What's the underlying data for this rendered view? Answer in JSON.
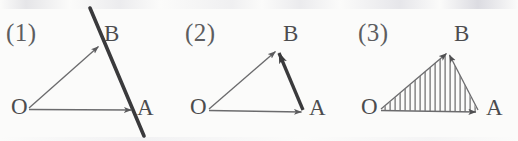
{
  "figure": {
    "caption_numbers": [
      "(1)",
      "(2)",
      "(3)"
    ],
    "background_color": "#fbfbfa",
    "ink_color": "#4c4c4e",
    "thin_stroke_color": "#6b6b6d",
    "thick_stroke_color": "#3a3a3c"
  },
  "panels": [
    {
      "number": "(1)",
      "vertices": {
        "O": {
          "label": "O",
          "x": 28,
          "y": 109
        },
        "A": {
          "label": "A",
          "x": 133,
          "y": 110
        },
        "B": {
          "label": "B",
          "x": 100,
          "y": 45
        }
      },
      "arrows": [
        {
          "name": "vector-OA",
          "from": "O",
          "to": "A",
          "style": "thin",
          "arrowhead": "at-tip"
        },
        {
          "name": "vector-OB",
          "from": "O",
          "to": "B",
          "style": "thin",
          "arrowhead": "at-tip"
        }
      ],
      "extra_line": {
        "name": "line-through-A-and-B",
        "style": "thick",
        "x1": 90,
        "y1": 8,
        "x2": 144,
        "y2": 136
      },
      "hatched": false
    },
    {
      "number": "(2)",
      "vertices": {
        "O": {
          "label": "O",
          "x": 36,
          "y": 110
        },
        "A": {
          "label": "A",
          "x": 131,
          "y": 112
        },
        "B": {
          "label": "B",
          "x": 105,
          "y": 50
        }
      },
      "arrows": [
        {
          "name": "vector-OA",
          "from": "O",
          "to": "A",
          "style": "thin",
          "arrowhead": "at-tip"
        },
        {
          "name": "vector-OB",
          "from": "O",
          "to": "B",
          "style": "thin",
          "arrowhead": "at-tip"
        },
        {
          "name": "vector-AB",
          "from": "A",
          "to": "B",
          "style": "thick",
          "arrowhead": "at-tip"
        }
      ],
      "extra_line": null,
      "hatched": false
    },
    {
      "number": "(3)",
      "vertices": {
        "O": {
          "label": "O",
          "x": 36,
          "y": 110
        },
        "A": {
          "label": "A",
          "x": 134,
          "y": 112
        },
        "B": {
          "label": "B",
          "x": 104,
          "y": 52
        }
      },
      "arrows": [
        {
          "name": "vector-OA",
          "from": "O",
          "to": "A",
          "style": "thin",
          "arrowhead": "at-tip"
        },
        {
          "name": "vector-OB",
          "from": "O",
          "to": "B",
          "style": "thin",
          "arrowhead": "at-tip"
        },
        {
          "name": "vector-AB",
          "from": "A",
          "to": "B",
          "style": "thin",
          "arrowhead": "at-tip"
        }
      ],
      "extra_line": null,
      "hatched": true,
      "hatch": {
        "orientation": "vertical",
        "spacing_px": 5,
        "stroke_width": 1.1
      }
    }
  ]
}
